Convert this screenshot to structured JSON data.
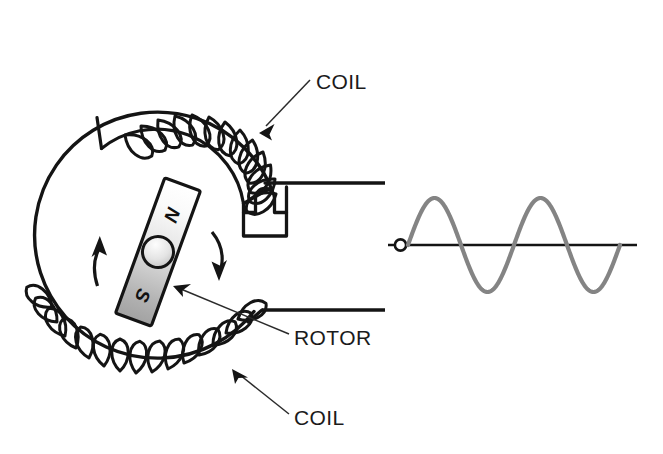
{
  "figure": {
    "background_color": "#ffffff",
    "line_color": "#141414",
    "waveform_color": "#848484"
  },
  "labels": {
    "coil_top": "COIL",
    "coil_bottom": "COIL",
    "rotor": "ROTOR"
  },
  "rotor": {
    "north_pole": "N",
    "south_pole": "S",
    "tilt_degrees": 20,
    "magnet_light_color": "#fdfdfd",
    "magnet_dark_color": "#9a9a9a",
    "shaft_label": "shaft"
  },
  "stator": {
    "outer_radius": 123,
    "center_x": 157,
    "center_y": 250,
    "top_coil_turns": 13,
    "bottom_coil_turns": 15,
    "lead_wire_count": 2
  },
  "chart_data": {
    "type": "line",
    "title": "",
    "xlabel": "",
    "ylabel": "",
    "series": [
      {
        "name": "induced EMF",
        "color": "#848484",
        "x": [
          0,
          0.125,
          0.25,
          0.375,
          0.5,
          0.625,
          0.75,
          0.875,
          1.0,
          1.125,
          1.25,
          1.375,
          1.5,
          1.625,
          1.75,
          1.875,
          2.0
        ],
        "y": [
          0,
          0.707,
          1.0,
          0.707,
          0,
          -0.707,
          -1.0,
          -0.707,
          0,
          0.707,
          1.0,
          0.707,
          0,
          -0.707,
          -1.0,
          -0.707,
          0
        ]
      }
    ],
    "cycles": 2,
    "amplitude": 1.0,
    "xlim": [
      0,
      2
    ],
    "ylim": [
      -1.15,
      1.15
    ],
    "grid": false,
    "legend": false,
    "axis_line": true,
    "origin_marker": "open-circle"
  }
}
